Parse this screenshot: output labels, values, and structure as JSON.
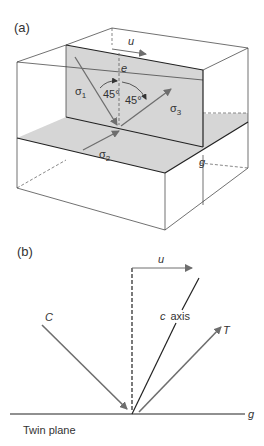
{
  "panel_a": {
    "label": "(a)",
    "u": "u",
    "e": "e",
    "g": "g",
    "sigma1": "σ",
    "sigma1_sub": "1",
    "sigma2": "σ",
    "sigma2_sub": "2",
    "sigma3": "σ",
    "sigma3_sub": "3",
    "angle1": "45°",
    "angle2": "45°"
  },
  "panel_b": {
    "label": "(b)",
    "u": "u",
    "C": "C",
    "c_axis": "c  axis",
    "T": "T",
    "g": "g",
    "twin_plane": "Twin plane"
  },
  "colors": {
    "plane_fill": "#d6d6d6",
    "line": "#333333",
    "arrow": "#6e6e6e"
  }
}
